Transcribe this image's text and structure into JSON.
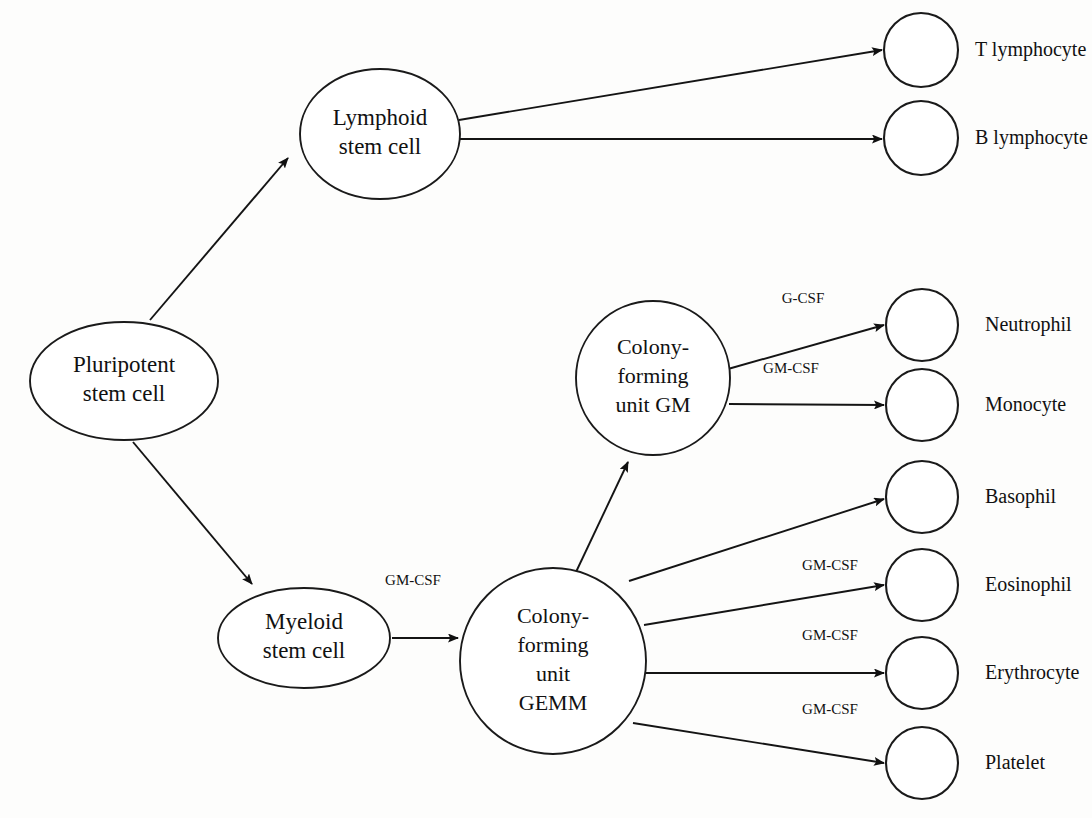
{
  "diagram": {
    "type": "flow-diagram",
    "background_color": "#fdfdfc",
    "stroke_color": "#141414",
    "nodes": [
      {
        "id": "pluripotent",
        "label_line1": "Pluripotent",
        "label_line2": "stem cell",
        "label_line3": "",
        "label_line4": "",
        "shape": "ellipse",
        "cx": 124,
        "cy": 381,
        "rx": 94,
        "ry": 59
      },
      {
        "id": "lymphoid",
        "label_line1": "Lymphoid",
        "label_line2": "stem cell",
        "label_line3": "",
        "label_line4": "",
        "shape": "ellipse",
        "cx": 380,
        "cy": 134,
        "rx": 80,
        "ry": 65
      },
      {
        "id": "myeloid",
        "label_line1": "Myeloid",
        "label_line2": "stem cell",
        "label_line3": "",
        "label_line4": "",
        "shape": "ellipse",
        "cx": 304,
        "cy": 638,
        "rx": 86,
        "ry": 50
      },
      {
        "id": "cfu-gm",
        "label_line1": "Colony-",
        "label_line2": "forming",
        "label_line3": "unit GM",
        "label_line4": "",
        "shape": "circle",
        "cx": 653,
        "cy": 378,
        "rx": 77,
        "ry": 77
      },
      {
        "id": "cfu-gemm",
        "label_line1": "Colony-",
        "label_line2": "forming",
        "label_line3": "unit",
        "label_line4": "GEMM",
        "shape": "circle",
        "cx": 553,
        "cy": 661,
        "rx": 93,
        "ry": 93
      }
    ],
    "cells": [
      {
        "id": "t-lymphocyte",
        "label": "T lymphocyte",
        "cx": 921,
        "cy": 50,
        "r": 37,
        "label_x": 975
      },
      {
        "id": "b-lymphocyte",
        "label": "B lymphocyte",
        "cx": 921,
        "cy": 138,
        "r": 37,
        "label_x": 975
      },
      {
        "id": "neutrophil",
        "label": "Neutrophil",
        "cx": 922,
        "cy": 325,
        "r": 36,
        "label_x": 985
      },
      {
        "id": "monocyte",
        "label": "Monocyte",
        "cx": 922,
        "cy": 405,
        "r": 36,
        "label_x": 985
      },
      {
        "id": "basophil",
        "label": "Basophil",
        "cx": 922,
        "cy": 497,
        "r": 36,
        "label_x": 985
      },
      {
        "id": "eosinophil",
        "label": "Eosinophil",
        "cx": 922,
        "cy": 585,
        "r": 36,
        "label_x": 985
      },
      {
        "id": "erythrocyte",
        "label": "Erythrocyte",
        "cx": 922,
        "cy": 673,
        "r": 36,
        "label_x": 985
      },
      {
        "id": "platelet",
        "label": "Platelet",
        "cx": 922,
        "cy": 763,
        "r": 36,
        "label_x": 985
      }
    ],
    "edges": [
      {
        "id": "pluripotent-to-lymphoid",
        "from": "pluripotent",
        "to": "lymphoid",
        "x1": 150,
        "y1": 320,
        "x2": 288,
        "y2": 158,
        "factor": ""
      },
      {
        "id": "pluripotent-to-myeloid",
        "from": "pluripotent",
        "to": "myeloid",
        "x1": 133,
        "y1": 442,
        "x2": 252,
        "y2": 584,
        "factor": ""
      },
      {
        "id": "lymphoid-to-t",
        "from": "lymphoid",
        "to": "t-lymphocyte",
        "x1": 459,
        "y1": 120,
        "x2": 882,
        "y2": 50,
        "factor": ""
      },
      {
        "id": "lymphoid-to-b",
        "from": "lymphoid",
        "to": "b-lymphocyte",
        "x1": 459,
        "y1": 139,
        "x2": 882,
        "y2": 139,
        "factor": ""
      },
      {
        "id": "myeloid-to-gemm",
        "from": "myeloid",
        "to": "cfu-gemm",
        "x1": 392,
        "y1": 638,
        "x2": 458,
        "y2": 638,
        "factor": "GM-CSF",
        "factor_x": 413,
        "factor_y": 582
      },
      {
        "id": "gemm-to-gm",
        "from": "cfu-gemm",
        "to": "cfu-gm",
        "x1": 576,
        "y1": 572,
        "x2": 628,
        "y2": 462,
        "factor": ""
      },
      {
        "id": "gm-to-neutrophil",
        "from": "cfu-gm",
        "to": "neutrophil",
        "x1": 728,
        "y1": 369,
        "x2": 884,
        "y2": 325,
        "factor": "G-CSF",
        "factor_x": 803,
        "factor_y": 300
      },
      {
        "id": "gm-to-monocyte",
        "from": "cfu-gm",
        "to": "monocyte",
        "x1": 729,
        "y1": 404,
        "x2": 884,
        "y2": 405,
        "factor": "GM-CSF",
        "factor_x": 791,
        "factor_y": 370
      },
      {
        "id": "gemm-to-basophil",
        "from": "cfu-gemm",
        "to": "basophil",
        "x1": 629,
        "y1": 581,
        "x2": 884,
        "y2": 499,
        "factor": ""
      },
      {
        "id": "gemm-to-eosinophil",
        "from": "cfu-gemm",
        "to": "eosinophil",
        "x1": 644,
        "y1": 625,
        "x2": 884,
        "y2": 585,
        "factor": "GM-CSF",
        "factor_x": 830,
        "factor_y": 567
      },
      {
        "id": "gemm-to-erythrocyte",
        "from": "cfu-gemm",
        "to": "erythrocyte",
        "x1": 646,
        "y1": 673,
        "x2": 884,
        "y2": 673,
        "factor": "GM-CSF",
        "factor_x": 830,
        "factor_y": 637
      },
      {
        "id": "gemm-to-platelet",
        "from": "cfu-gemm",
        "to": "platelet",
        "x1": 633,
        "y1": 723,
        "x2": 884,
        "y2": 763,
        "factor": "GM-CSF",
        "factor_x": 830,
        "factor_y": 711
      }
    ]
  }
}
